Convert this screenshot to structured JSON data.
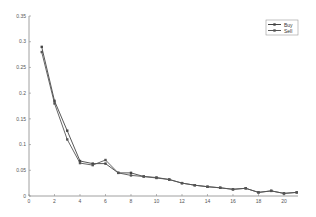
{
  "chart_data": {
    "type": "line",
    "title": "",
    "xlabel": "",
    "ylabel": "",
    "xlim": [
      0,
      21.1
    ],
    "ylim": [
      0,
      0.35
    ],
    "grid": false,
    "legend_position": "upper right",
    "x_ticks": [
      0,
      2,
      4,
      6,
      8,
      10,
      12,
      14,
      16,
      18,
      20
    ],
    "y_ticks": [
      0,
      0.05,
      0.1,
      0.15,
      0.2,
      0.25,
      0.3,
      0.35
    ],
    "x": [
      1,
      2,
      3,
      4,
      5,
      6,
      7,
      8,
      9,
      10,
      11,
      12,
      13,
      14,
      15,
      16,
      17,
      18,
      19,
      20,
      21
    ],
    "series": [
      {
        "name": "Buy",
        "color": "#444444",
        "values": [
          0.29,
          0.185,
          0.127,
          0.068,
          0.063,
          0.063,
          0.045,
          0.045,
          0.038,
          0.036,
          0.032,
          0.025,
          0.021,
          0.018,
          0.016,
          0.013,
          0.015,
          0.007,
          0.01,
          0.005,
          0.007
        ]
      },
      {
        "name": "Sell",
        "color": "#555555",
        "values": [
          0.28,
          0.18,
          0.11,
          0.064,
          0.06,
          0.07,
          0.045,
          0.04,
          0.038,
          0.035,
          0.032,
          0.025,
          0.021,
          0.018,
          0.016,
          0.013,
          0.015,
          0.007,
          0.01,
          0.005,
          0.007
        ]
      }
    ]
  },
  "legend": {
    "items": [
      "Buy",
      "Sell"
    ]
  }
}
